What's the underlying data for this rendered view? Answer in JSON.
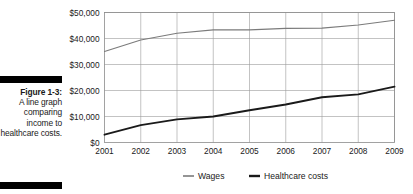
{
  "caption": {
    "label": "Figure 1-3:",
    "body": "A line graph comparing income to healthcare costs.",
    "rule_color": "#000000"
  },
  "chart_data": {
    "type": "line",
    "title": "",
    "xlabel": "",
    "ylabel": "",
    "categories": [
      "2001",
      "2002",
      "2003",
      "2004",
      "2005",
      "2006",
      "2007",
      "2008",
      "2009"
    ],
    "x": [
      2001,
      2002,
      2003,
      2004,
      2005,
      2006,
      2007,
      2008,
      2009
    ],
    "series": [
      {
        "name": "Wages",
        "color": "#7b7b7b",
        "width": 1.1,
        "values": [
          35000,
          39400,
          42000,
          43300,
          43300,
          43900,
          44000,
          45200,
          47000
        ]
      },
      {
        "name": "Healthcare costs",
        "color": "#1a1a1a",
        "width": 1.9,
        "values": [
          3000,
          6700,
          8900,
          10000,
          12400,
          14600,
          17400,
          18500,
          21500
        ]
      }
    ],
    "ylim": [
      0,
      50000
    ],
    "yticks": [
      0,
      10000,
      20000,
      30000,
      40000,
      50000
    ],
    "ytick_labels": [
      "$0",
      "$10,000",
      "$20,000",
      "$30,000",
      "$40,000",
      "$50,000"
    ],
    "grid": true,
    "grid_color": "#9a9a9a",
    "legend_position": "bottom",
    "legend": [
      "Wages",
      "Healthcare costs"
    ]
  },
  "axis": {
    "y_labels": [
      "$50,000",
      "$40,000",
      "$30,000",
      "$20,000",
      "$10,000",
      "$0"
    ],
    "x_labels": [
      "2001",
      "2002",
      "2003",
      "2004",
      "2005",
      "2006",
      "2007",
      "2008",
      "2009"
    ]
  },
  "legend": {
    "items": [
      {
        "label": "Wages",
        "color": "#7b7b7b"
      },
      {
        "label": "Healthcare costs",
        "color": "#1a1a1a"
      }
    ]
  }
}
